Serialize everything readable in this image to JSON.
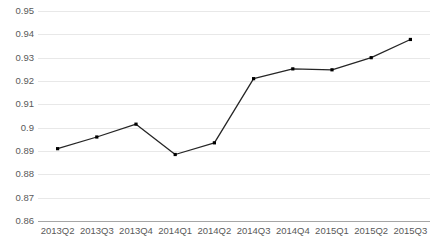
{
  "chart_data": {
    "type": "line",
    "title": "",
    "subtitle": "",
    "xlabel": "",
    "ylabel": "",
    "categories": [
      "2013Q2",
      "2013Q3",
      "2013Q4",
      "2014Q1",
      "2014Q2",
      "2014Q3",
      "2014Q4",
      "2015Q1",
      "2015Q2",
      "2015Q3"
    ],
    "values": [
      0.891,
      0.896,
      0.9015,
      0.8885,
      0.8935,
      0.921,
      0.9252,
      0.9248,
      0.93,
      0.9378
    ],
    "series": [
      {
        "name": "series-1",
        "values": [
          0.891,
          0.896,
          0.9015,
          0.8885,
          0.8935,
          0.921,
          0.9252,
          0.9248,
          0.93,
          0.9378
        ]
      }
    ],
    "ylim": [
      0.86,
      0.95
    ],
    "ytick_step": 0.01,
    "ytick_labels": [
      "0.95",
      "0.94",
      "0.93",
      "0.92",
      "0.91",
      "0.9",
      "0.89",
      "0.88",
      "0.87",
      "0.86"
    ],
    "ytick_values": [
      0.95,
      0.94,
      0.93,
      0.92,
      0.91,
      0.9,
      0.89,
      0.88,
      0.87,
      0.86
    ],
    "grid": true,
    "grid_axis": "y",
    "legend": false,
    "legend_position": "none",
    "marker": "square",
    "line_color": "#262626",
    "marker_color": "#000000",
    "gridline_color": "#e8e8e8",
    "axis_color": "#a6a6a6",
    "tick_label_color": "#595959",
    "background_color": "#ffffff",
    "annotations": []
  }
}
